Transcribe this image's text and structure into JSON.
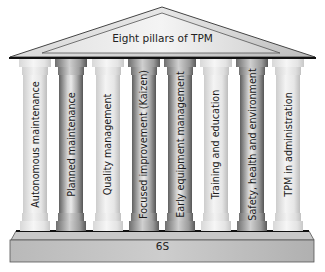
{
  "title": "Eight pillars of TPM",
  "pillars": [
    {
      "label": "Autonomous maintenance",
      "x": 19,
      "tone": "light"
    },
    {
      "label": "Planned maintenance",
      "x": 55,
      "tone": "dark"
    },
    {
      "label": "Quality management",
      "x": 92,
      "tone": "light"
    },
    {
      "label": "Focused improvement (Kaizen)",
      "x": 128,
      "tone": "dark"
    },
    {
      "label": "Early equipment management",
      "x": 164,
      "tone": "dark"
    },
    {
      "label": "Training and education",
      "x": 200,
      "tone": "light"
    },
    {
      "label": "Safety, health and environment",
      "x": 236,
      "tone": "dark"
    },
    {
      "label": "TPM in administration",
      "x": 272,
      "tone": "light"
    }
  ],
  "foundation": {
    "label": "6S"
  },
  "colors": {
    "roof_fill": "#d9d9d9",
    "roof_edge": "#222222",
    "base_fill": "#bdbdbd",
    "text": "#222222"
  }
}
